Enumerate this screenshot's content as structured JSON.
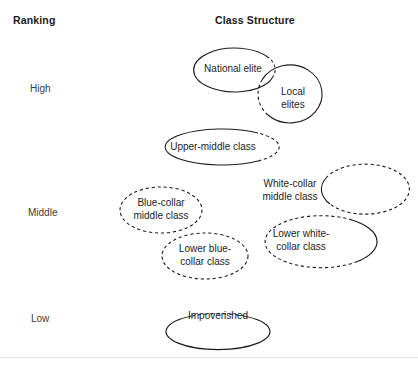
{
  "diagram": {
    "headers": {
      "ranking": "Ranking",
      "class_structure": "Class Structure"
    },
    "rank_labels": [
      {
        "id": "high",
        "label": "High"
      },
      {
        "id": "middle",
        "label": "Middle"
      },
      {
        "id": "low",
        "label": "Low"
      }
    ],
    "nodes": [
      {
        "id": "national-elite",
        "label": "National elite",
        "stroke": "#1d1d1d"
      },
      {
        "id": "local-elites",
        "label": "Local\nelites",
        "stroke": "#1d1d1d"
      },
      {
        "id": "upper-middle-class",
        "label": "Upper-middle class",
        "stroke": "#1d1d1d"
      },
      {
        "id": "white-collar-middle-class",
        "label": "White-collar\nmiddle class",
        "stroke": "#1d1d1d"
      },
      {
        "id": "blue-collar-middle-class",
        "label": "Blue-collar\nmiddle class",
        "stroke": "#1d1d1d"
      },
      {
        "id": "lower-white-collar-class",
        "label": "Lower white-\ncollar class",
        "stroke": "#1d1d1d"
      },
      {
        "id": "lower-blue-collar-class",
        "label": "Lower blue-\ncollar class",
        "stroke": "#1d1d1d"
      },
      {
        "id": "impoverished",
        "label": "Impoverished",
        "stroke": "#1d1d1d"
      }
    ],
    "colors": {
      "background": "#ffffff",
      "text": "#1d1d1d",
      "header_text": "#1a1a1a",
      "rank_text": "#3a3a3a",
      "outline": "#1d1d1d",
      "rule": "#e8e8e8"
    }
  }
}
